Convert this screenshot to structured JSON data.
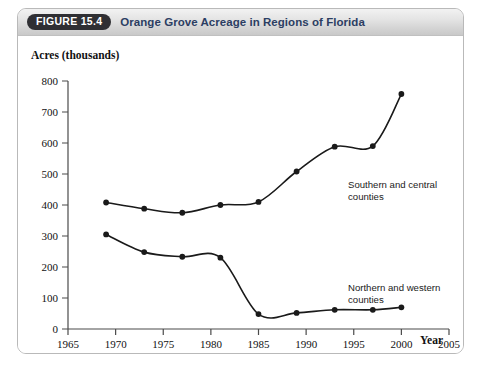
{
  "figure": {
    "badge": "FIGURE 15.4",
    "title": "Orange Grove Acreage in Regions of Florida",
    "badge_color": "#2f2f33",
    "title_color": "#2c3e63",
    "border_color": "#b9b9b9"
  },
  "chart_data": {
    "type": "line",
    "title": "Orange Grove Acreage in Regions of Florida",
    "xlabel": "Year",
    "ylabel": "Acres (thousands)",
    "xlim": [
      1965,
      2005
    ],
    "ylim": [
      0,
      800
    ],
    "xticks": [
      1965,
      1970,
      1975,
      1980,
      1985,
      1990,
      1995,
      2000,
      2005
    ],
    "yticks": [
      0,
      100,
      200,
      300,
      400,
      500,
      600,
      700,
      800
    ],
    "grid": false,
    "legend_position": "inline-annotations",
    "marker": "filled-circle",
    "line_color": "#1a1a1a",
    "series": [
      {
        "name": "Southern and central counties",
        "label_line1": "Southern and central",
        "label_line2": "counties",
        "x": [
          1969,
          1973,
          1977,
          1981,
          1985,
          1989,
          1993,
          1997,
          2000
        ],
        "values": [
          408,
          388,
          375,
          400,
          410,
          508,
          588,
          590,
          758
        ]
      },
      {
        "name": "Northern and western counties",
        "label_line1": "Northern and western",
        "label_line2": "counties",
        "x": [
          1969,
          1973,
          1977,
          1981,
          1985,
          1989,
          1993,
          1997,
          2000
        ],
        "values": [
          305,
          248,
          233,
          230,
          48,
          52,
          62,
          62,
          70
        ]
      }
    ]
  }
}
